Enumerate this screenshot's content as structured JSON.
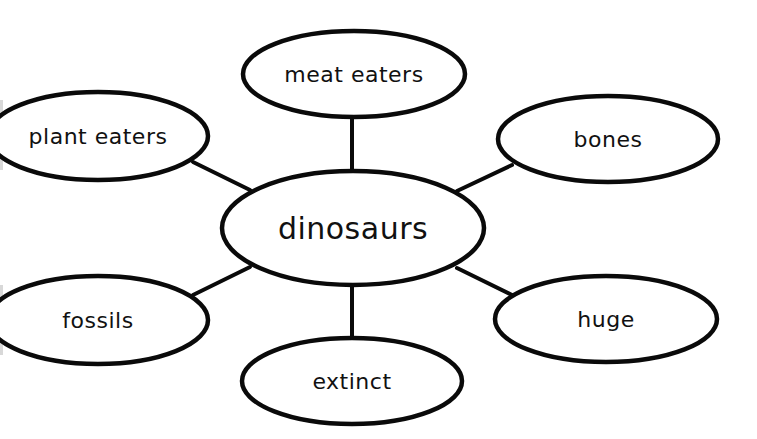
{
  "diagram": {
    "type": "concept-web",
    "colors": {
      "stroke": "#0a0a0a",
      "fill": "#ffffff",
      "text": "#111111",
      "background": "#ffffff"
    },
    "center": {
      "label": "dinosaurs",
      "cx": 353,
      "cy": 228,
      "rx": 131,
      "ry": 57
    },
    "nodes": [
      {
        "id": "meat-eaters",
        "label": "meat eaters",
        "cx": 354,
        "cy": 74,
        "rx": 111,
        "ry": 43,
        "line": [
          352,
          118,
          352,
          171
        ]
      },
      {
        "id": "plant-eaters",
        "label": "plant eaters",
        "cx": 98,
        "cy": 136,
        "rx": 110,
        "ry": 44,
        "line": [
          193,
          162,
          250,
          190
        ]
      },
      {
        "id": "bones",
        "label": "bones",
        "cx": 608,
        "cy": 139,
        "rx": 110,
        "ry": 43,
        "line": [
          512,
          165,
          457,
          191
        ]
      },
      {
        "id": "fossils",
        "label": "fossils",
        "cx": 98,
        "cy": 320,
        "rx": 110,
        "ry": 44,
        "line": [
          193,
          295,
          250,
          267
        ]
      },
      {
        "id": "huge",
        "label": "huge",
        "cx": 606,
        "cy": 319,
        "rx": 111,
        "ry": 43,
        "line": [
          512,
          295,
          457,
          268
        ]
      },
      {
        "id": "extinct",
        "label": "extinct",
        "cx": 352,
        "cy": 381,
        "rx": 110,
        "ry": 43,
        "line": [
          352,
          286,
          352,
          337
        ]
      }
    ]
  }
}
